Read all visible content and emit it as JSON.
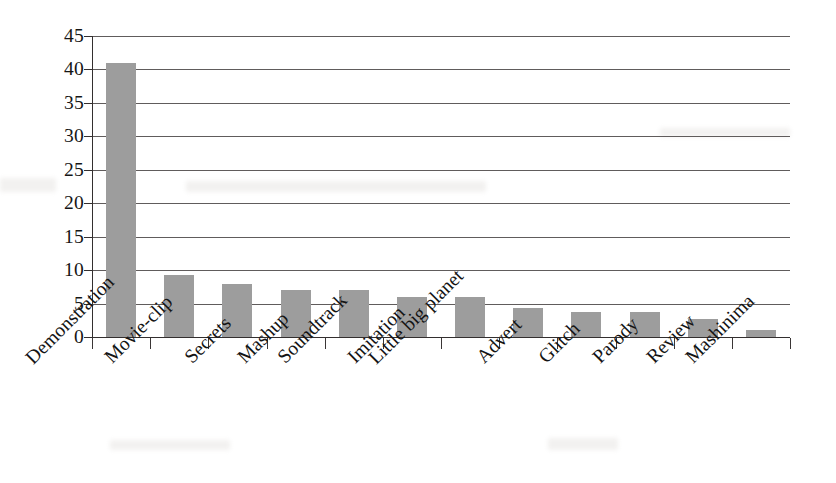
{
  "chart_data": {
    "type": "bar",
    "title": "",
    "xlabel": "",
    "ylabel": "",
    "ylim": [
      0,
      45
    ],
    "ytick_step": 5,
    "grid": true,
    "legend": false,
    "bar_color": "#9d9d9d",
    "axis_color": "#332f2f",
    "categories": [
      "Demonstration",
      "Movie-clip",
      "Secrets",
      "Mashup",
      "Soundtrack",
      "Imitation",
      "Little big planet",
      "Advert",
      "Glitch",
      "Parody",
      "Review",
      "Mashinima"
    ],
    "values": [
      41,
      9.2,
      8,
      7,
      7,
      6,
      6,
      4.3,
      3.7,
      3.8,
      2.7,
      1.1
    ],
    "yticks": [
      0,
      5,
      10,
      15,
      20,
      25,
      30,
      35,
      40,
      45
    ],
    "ytick_labels": [
      "0",
      "5",
      "10",
      "15",
      "20",
      "25",
      "30",
      "35",
      "40",
      "45"
    ]
  }
}
